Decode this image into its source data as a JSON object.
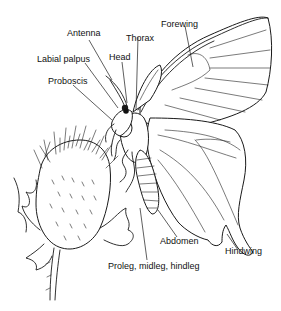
{
  "figure": {
    "labels": {
      "antenna": "Antenna",
      "thorax": "Thorax",
      "forewing": "Forewing",
      "head": "Head",
      "labial_palpus": "Labial palpus",
      "proboscis": "Proboscis",
      "abdomen": "Abdomen",
      "hindwing": "Hindwing",
      "legs": "Proleg, midleg, hindleg"
    }
  }
}
